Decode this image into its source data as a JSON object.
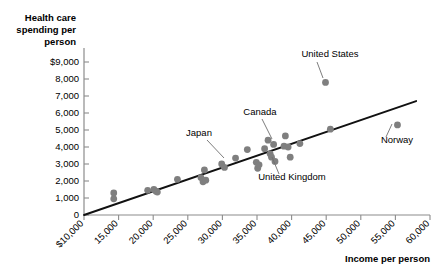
{
  "chart_data": {
    "type": "scatter",
    "title": "",
    "ylabel": "Health care spending per person",
    "xlabel": "Income per person",
    "xlim": [
      10000,
      60000
    ],
    "ylim": [
      0,
      9500
    ],
    "grid": false,
    "legend": null,
    "x_ticks": [
      {
        "value": 10000,
        "label": "$10,000"
      },
      {
        "value": 15000,
        "label": "15,000"
      },
      {
        "value": 20000,
        "label": "20,000"
      },
      {
        "value": 25000,
        "label": "25,000"
      },
      {
        "value": 30000,
        "label": "30,000"
      },
      {
        "value": 35000,
        "label": "35,000"
      },
      {
        "value": 40000,
        "label": "40,000"
      },
      {
        "value": 45000,
        "label": "45,000"
      },
      {
        "value": 50000,
        "label": "50,000"
      },
      {
        "value": 55000,
        "label": "55,000"
      },
      {
        "value": 60000,
        "label": "60,000"
      }
    ],
    "y_ticks": [
      {
        "value": 0,
        "label": "0"
      },
      {
        "value": 1000,
        "label": "1,000"
      },
      {
        "value": 2000,
        "label": "2,000"
      },
      {
        "value": 3000,
        "label": "3,000"
      },
      {
        "value": 4000,
        "label": "4,000"
      },
      {
        "value": 5000,
        "label": "5,000"
      },
      {
        "value": 6000,
        "label": "6,000"
      },
      {
        "value": 7000,
        "label": "7,000"
      },
      {
        "value": 8000,
        "label": "8,000"
      },
      {
        "value": 9000,
        "label": "$9,000"
      }
    ],
    "point_color": "#7f7f7f",
    "point_radius": 3.4,
    "trend_line": {
      "x0": 10000,
      "y0": 0,
      "x1": 58000,
      "y1": 6700,
      "color": "#111111"
    },
    "points": [
      {
        "x": 14300,
        "y": 1300
      },
      {
        "x": 14300,
        "y": 950
      },
      {
        "x": 19200,
        "y": 1450
      },
      {
        "x": 20100,
        "y": 1500
      },
      {
        "x": 20400,
        "y": 1400
      },
      {
        "x": 20600,
        "y": 1350
      },
      {
        "x": 23500,
        "y": 2100
      },
      {
        "x": 26900,
        "y": 2200
      },
      {
        "x": 27200,
        "y": 1950
      },
      {
        "x": 27400,
        "y": 2650
      },
      {
        "x": 27600,
        "y": 2050
      },
      {
        "x": 29900,
        "y": 3000
      },
      {
        "x": 30300,
        "y": 2800
      },
      {
        "x": 31900,
        "y": 3350
      },
      {
        "x": 33600,
        "y": 3850
      },
      {
        "x": 34900,
        "y": 3100
      },
      {
        "x": 35100,
        "y": 2750
      },
      {
        "x": 35300,
        "y": 2950
      },
      {
        "x": 36100,
        "y": 3900
      },
      {
        "x": 36600,
        "y": 4400
      },
      {
        "x": 36900,
        "y": 3600
      },
      {
        "x": 37100,
        "y": 3400
      },
      {
        "x": 37400,
        "y": 4150
      },
      {
        "x": 37600,
        "y": 3150
      },
      {
        "x": 38900,
        "y": 4050
      },
      {
        "x": 39100,
        "y": 4650
      },
      {
        "x": 39500,
        "y": 4000
      },
      {
        "x": 39800,
        "y": 3400
      },
      {
        "x": 41200,
        "y": 4200
      },
      {
        "x": 44900,
        "y": 7800
      },
      {
        "x": 45600,
        "y": 5050
      },
      {
        "x": 55300,
        "y": 5300
      }
    ],
    "annotations": [
      {
        "label": "United States",
        "text_x": 330,
        "text_y": 57,
        "anchor": "middle",
        "leader": {
          "x1": 317,
          "y1": 62,
          "x2": 323,
          "y2": 78
        }
      },
      {
        "label": "Canada",
        "text_x": 260,
        "text_y": 115,
        "anchor": "middle",
        "leader": {
          "x1": 262,
          "y1": 119,
          "x2": 272,
          "y2": 139
        }
      },
      {
        "label": "Japan",
        "text_x": 199,
        "text_y": 136,
        "anchor": "middle",
        "leader": {
          "x1": 207,
          "y1": 140,
          "x2": 224,
          "y2": 158
        }
      },
      {
        "label": "United Kingdom",
        "text_x": 292,
        "text_y": 180,
        "anchor": "middle",
        "leader": {
          "x1": 279,
          "y1": 174,
          "x2": 272,
          "y2": 157
        }
      },
      {
        "label": "Norway",
        "text_x": 397,
        "text_y": 143,
        "anchor": "middle",
        "leader": {
          "x1": 386,
          "y1": 137,
          "x2": 392,
          "y2": 124
        }
      }
    ]
  },
  "axis_titles": {
    "y_line1": "Health care",
    "y_line2": "spending per",
    "y_line3": "person",
    "x_title": "Income per person"
  }
}
